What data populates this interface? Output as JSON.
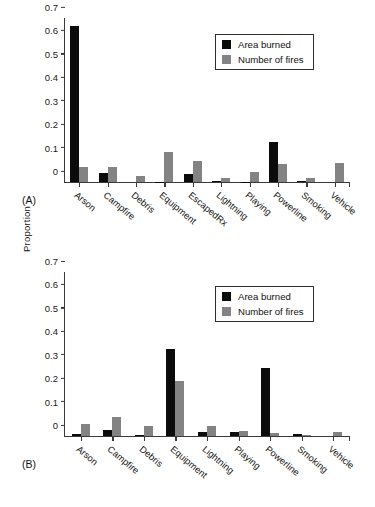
{
  "figure": {
    "y_axis_title": "Proportion",
    "panels": [
      {
        "tag": "(A)"
      },
      {
        "tag": "(B)"
      }
    ]
  },
  "legend": {
    "entries": [
      {
        "label": "Area burned",
        "color": "#0b0b0b"
      },
      {
        "label": "Number of fires",
        "color": "#838383"
      }
    ]
  },
  "axis": {
    "ticks": [
      "0.7",
      "0.6",
      "0.5",
      "0.4",
      "0.3",
      "0.2",
      "0.1",
      "0"
    ]
  },
  "chart_data": [
    {
      "type": "bar",
      "panel": "(A)",
      "title": "",
      "xlabel": "",
      "ylabel": "Proportion",
      "ylim": [
        0,
        0.7
      ],
      "ytick_values": [
        0,
        0.1,
        0.2,
        0.3,
        0.4,
        0.5,
        0.6,
        0.7
      ],
      "grid": false,
      "legend_position": "top-right",
      "categories": [
        "Arson",
        "Campfire",
        "Debris",
        "Equipment",
        "EscapedRx",
        "Lightning",
        "Playing",
        "Powerline",
        "Smoking",
        "Vehicle"
      ],
      "series": [
        {
          "name": "Area burned",
          "color": "#0b0b0b",
          "values": [
            0.668,
            0.04,
            0.0,
            0.001,
            0.033,
            0.003,
            0.001,
            0.172,
            0.005,
            0.0
          ]
        },
        {
          "name": "Number of fires",
          "color": "#838383",
          "values": [
            0.066,
            0.065,
            0.025,
            0.13,
            0.089,
            0.019,
            0.044,
            0.075,
            0.018,
            0.082
          ]
        }
      ]
    },
    {
      "type": "bar",
      "panel": "(B)",
      "title": "",
      "xlabel": "",
      "ylabel": "Proportion",
      "ylim": [
        0,
        0.7
      ],
      "ytick_values": [
        0,
        0.1,
        0.2,
        0.3,
        0.4,
        0.5,
        0.6,
        0.7
      ],
      "grid": false,
      "legend_position": "top-right",
      "categories": [
        "Arson",
        "Campfire",
        "Debris",
        "Equipment",
        "Lightning",
        "Playing",
        "Powerline",
        "Smoking",
        "Vehicle"
      ],
      "series": [
        {
          "name": "Area burned",
          "color": "#0b0b0b",
          "values": [
            0.008,
            0.027,
            0.005,
            0.37,
            0.016,
            0.016,
            0.289,
            0.007,
            0.0
          ]
        },
        {
          "name": "Number of fires",
          "color": "#838383",
          "values": [
            0.053,
            0.081,
            0.041,
            0.235,
            0.041,
            0.02,
            0.011,
            0.004,
            0.018
          ]
        }
      ]
    }
  ]
}
